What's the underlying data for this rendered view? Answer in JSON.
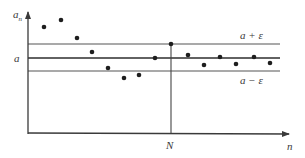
{
  "diagram": {
    "title": "",
    "colors": {
      "axis": "#3a3a3a",
      "band_line": "#555555",
      "limit_line": "#2e2e2e",
      "dot": "#1e1e1e",
      "label": "#3a3a3a"
    },
    "axes": {
      "y_label": "a",
      "y_label_sub": "n",
      "x_label": "n"
    },
    "lines": {
      "limit_label": "a",
      "upper_label": "a + ε",
      "lower_label": "a − ε",
      "n_marker_label": "N"
    },
    "points_px": [
      [
        44,
        27
      ],
      [
        61,
        20
      ],
      [
        77,
        38
      ],
      [
        92,
        52
      ],
      [
        108,
        68
      ],
      [
        124,
        78
      ],
      [
        139,
        75
      ],
      [
        155,
        58
      ],
      [
        171,
        44
      ],
      [
        188,
        55
      ],
      [
        204,
        65
      ],
      [
        220,
        57
      ],
      [
        236,
        64
      ],
      [
        254,
        57
      ],
      [
        270,
        63
      ]
    ]
  }
}
